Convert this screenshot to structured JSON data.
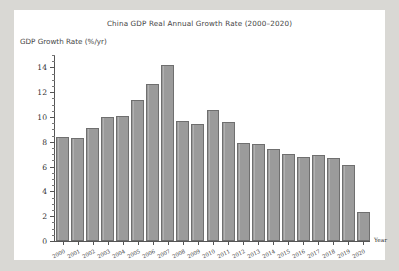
{
  "chart_data": {
    "type": "bar",
    "title": "China GDP Real Annual Growth Rate (2000–2020)",
    "xlabel": "Year",
    "ylabel": "GDP Growth Rate (%/yr)",
    "categories": [
      "2000",
      "2001",
      "2002",
      "2003",
      "2004",
      "2005",
      "2006",
      "2007",
      "2008",
      "2009",
      "2010",
      "2011",
      "2012",
      "2013",
      "2014",
      "2015",
      "2016",
      "2017",
      "2018",
      "2019",
      "2020"
    ],
    "values": [
      8.4,
      8.3,
      9.1,
      10.0,
      10.1,
      11.4,
      12.7,
      14.2,
      9.7,
      9.4,
      10.6,
      9.6,
      7.9,
      7.8,
      7.4,
      7.0,
      6.8,
      6.9,
      6.7,
      6.1,
      2.3
    ],
    "ylim": [
      0,
      15
    ],
    "yticks": [
      0,
      2,
      4,
      6,
      8,
      10,
      12,
      14
    ],
    "yminor_step": 0.5,
    "grid": false,
    "legend": null,
    "bar_color": "#9b9b9b",
    "bar_edge_color": "#6f6f6f",
    "background": "#ffffff",
    "page_background": "#d9d8d4"
  }
}
